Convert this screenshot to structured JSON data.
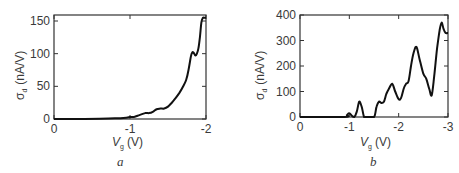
{
  "chart_data": [
    {
      "type": "line",
      "panel_label": "a",
      "title": "",
      "xlabel": "V_g (V)",
      "xlabel_main": "V",
      "xlabel_sub": "g",
      "xlabel_unit": "(V)",
      "ylabel": "σ_d (nA/V)",
      "ylabel_main": "σ",
      "ylabel_sub": "d",
      "ylabel_unit": "(nA/V)",
      "xlim": [
        0,
        -2
      ],
      "ylim": [
        0,
        160
      ],
      "xticks": [
        "0",
        "-1",
        "-2"
      ],
      "yticks": [
        "0",
        "50",
        "100",
        "150"
      ],
      "grid": false,
      "series": [
        {
          "name": "sigma_d",
          "x": [
            0,
            -0.3,
            -0.6,
            -0.8,
            -0.95,
            -1.0,
            -1.05,
            -1.1,
            -1.2,
            -1.25,
            -1.3,
            -1.35,
            -1.4,
            -1.45,
            -1.5,
            -1.55,
            -1.6,
            -1.65,
            -1.7,
            -1.74,
            -1.77,
            -1.8,
            -1.82,
            -1.84,
            -1.86,
            -1.88,
            -1.9,
            -1.92,
            -1.94,
            -1.96,
            -1.98,
            -2.0
          ],
          "y": [
            0,
            0,
            0.5,
            1,
            2,
            3,
            3,
            5,
            9,
            9,
            11,
            15,
            16,
            16,
            19,
            25,
            32,
            40,
            50,
            60,
            75,
            95,
            102,
            101,
            97,
            100,
            108,
            125,
            148,
            155,
            155,
            155
          ]
        }
      ]
    },
    {
      "type": "line",
      "panel_label": "b",
      "title": "",
      "xlabel": "V_g (V)",
      "xlabel_main": "V",
      "xlabel_sub": "g",
      "xlabel_unit": "(V)",
      "ylabel": "σ_d (nA/V)",
      "ylabel_main": "σ",
      "ylabel_sub": "d",
      "ylabel_unit": "(nA/V)",
      "xlim": [
        0,
        -3
      ],
      "ylim": [
        0,
        400
      ],
      "xticks": [
        "0",
        "-1",
        "-2",
        "-3"
      ],
      "yticks": [
        "0",
        "100",
        "200",
        "300",
        "400"
      ],
      "grid": false,
      "series": [
        {
          "name": "sigma_d",
          "x": [
            0,
            -0.9,
            -0.95,
            -1.0,
            -1.05,
            -1.1,
            -1.15,
            -1.2,
            -1.25,
            -1.3,
            -1.35,
            -1.5,
            -1.55,
            -1.6,
            -1.65,
            -1.7,
            -1.75,
            -1.8,
            -1.87,
            -1.93,
            -2.0,
            -2.05,
            -2.1,
            -2.15,
            -2.2,
            -2.25,
            -2.3,
            -2.36,
            -2.42,
            -2.5,
            -2.56,
            -2.62,
            -2.67,
            -2.72,
            -2.78,
            -2.83,
            -2.87,
            -2.91,
            -2.95,
            -3.0
          ],
          "y": [
            0,
            0,
            8,
            15,
            5,
            0,
            20,
            60,
            40,
            0,
            0,
            0,
            40,
            60,
            55,
            60,
            90,
            110,
            130,
            100,
            70,
            75,
            110,
            130,
            140,
            200,
            250,
            275,
            230,
            170,
            150,
            110,
            85,
            160,
            270,
            340,
            370,
            345,
            330,
            330
          ]
        }
      ]
    }
  ]
}
